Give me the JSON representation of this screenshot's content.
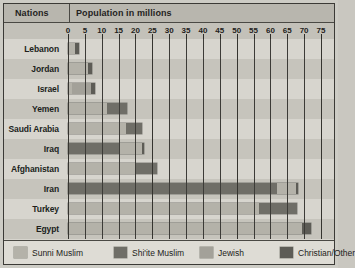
{
  "header": {
    "nations_label": "Nations",
    "population_label": "Population in millions"
  },
  "legend": {
    "items": [
      {
        "label": "Sunni Muslim",
        "color": "#b4b2a9",
        "key": "sunni"
      },
      {
        "label": "Shi'ite Muslim",
        "color": "#6f6e67",
        "key": "shia"
      },
      {
        "label": "Jewish",
        "color": "#a3a199",
        "key": "jewish"
      },
      {
        "label": "Christian/Other",
        "color": "#5d5c56",
        "key": "other"
      }
    ]
  },
  "chart_data": {
    "type": "bar",
    "orientation": "horizontal",
    "stacked": true,
    "title": "Population in millions",
    "xlabel": "Population in millions",
    "ylabel": "Nations",
    "xlim": [
      0,
      75
    ],
    "xticks": [
      0,
      5,
      10,
      15,
      20,
      25,
      30,
      35,
      40,
      45,
      50,
      55,
      60,
      65,
      70,
      75
    ],
    "grid": true,
    "legend_position": "bottom",
    "series": [
      {
        "name": "Sunni Muslim",
        "color": "#b4b2a9"
      },
      {
        "name": "Shi'ite Muslim",
        "color": "#6f6e67"
      },
      {
        "name": "Jewish",
        "color": "#a3a199"
      },
      {
        "name": "Christian/Other",
        "color": "#5d5c56"
      }
    ],
    "categories": [
      "Lebanon",
      "Jordan",
      "Israel",
      "Yemen",
      "Saudi Arabia",
      "Iraq",
      "Afghanistan",
      "Iran",
      "Turkey",
      "Egypt"
    ],
    "rows": [
      {
        "nation": "Lebanon",
        "segments": [
          {
            "key": "sunni",
            "value": 2.0
          },
          {
            "key": "other",
            "value": 1.2
          }
        ],
        "total": 3.2
      },
      {
        "nation": "Jordan",
        "segments": [
          {
            "key": "sunni",
            "value": 6.0
          },
          {
            "key": "other",
            "value": 1.2
          }
        ],
        "total": 7.2
      },
      {
        "nation": "Israel",
        "segments": [
          {
            "key": "sunni",
            "value": 1.3
          },
          {
            "key": "jewish",
            "value": 5.4
          },
          {
            "key": "other",
            "value": 1.3
          }
        ],
        "total": 8.0
      },
      {
        "nation": "Yemen",
        "segments": [
          {
            "key": "sunni",
            "value": 11.6
          },
          {
            "key": "shia",
            "value": 6.0
          }
        ],
        "total": 17.6
      },
      {
        "nation": "Saudi Arabia",
        "segments": [
          {
            "key": "sunni",
            "value": 17.2
          },
          {
            "key": "shia",
            "value": 4.8
          }
        ],
        "total": 22.0
      },
      {
        "nation": "Iraq",
        "segments": [
          {
            "key": "shia",
            "value": 15.4
          },
          {
            "key": "sunni",
            "value": 6.5
          },
          {
            "key": "other",
            "value": 0.7
          }
        ],
        "total": 22.6
      },
      {
        "nation": "Afghanistan",
        "segments": [
          {
            "key": "sunni",
            "value": 20.0
          },
          {
            "key": "shia",
            "value": 6.5
          }
        ],
        "total": 26.5
      },
      {
        "nation": "Iran",
        "segments": [
          {
            "key": "shia",
            "value": 62.0
          },
          {
            "key": "sunni",
            "value": 5.5
          },
          {
            "key": "other",
            "value": 0.6
          }
        ],
        "total": 68.1
      },
      {
        "nation": "Turkey",
        "segments": [
          {
            "key": "sunni",
            "value": 56.5
          },
          {
            "key": "shia",
            "value": 11.5
          }
        ],
        "total": 68.0
      },
      {
        "nation": "Egypt",
        "segments": [
          {
            "key": "sunni",
            "value": 69.5
          },
          {
            "key": "other",
            "value": 2.5
          }
        ],
        "total": 72.0
      }
    ]
  }
}
